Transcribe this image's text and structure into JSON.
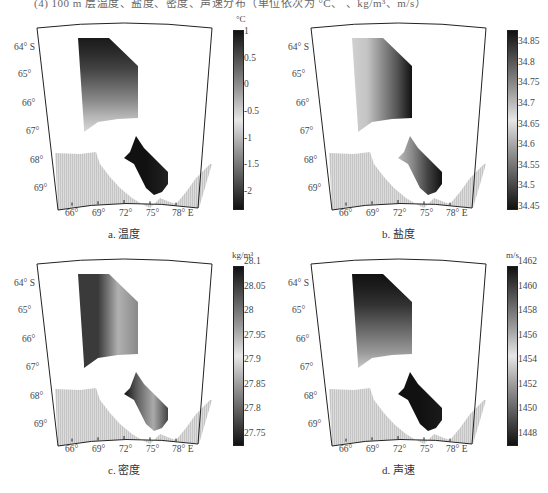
{
  "header_text": "(4) 100 m 层温度、盐度、密度、声速分布（单位依次为 °C、 、kg/m³、m/s）",
  "axes": {
    "lat_labels": [
      "64° S",
      "65°",
      "66°",
      "67°",
      "68°",
      "69°"
    ],
    "lon_labels": [
      "66°",
      "69°",
      "72°",
      "75°",
      "78° E"
    ]
  },
  "panels": [
    {
      "id": "a",
      "caption": "a. 温度",
      "unit": "°C",
      "colorbar_ticks": [
        "1",
        "0.5",
        "0",
        "-0.5",
        "-1",
        "-1.5",
        "-2"
      ],
      "colorbar_range": [
        -2.2,
        1.2
      ]
    },
    {
      "id": "b",
      "caption": "b. 盐度",
      "unit": "",
      "colorbar_ticks": [
        "34.85",
        "34.8",
        "34.75",
        "34.7",
        "34.65",
        "34.6",
        "34.55",
        "34.5",
        "34.45"
      ],
      "colorbar_range": [
        34.45,
        34.9
      ]
    },
    {
      "id": "c",
      "caption": "c. 密度",
      "unit": "kg/m³",
      "colorbar_ticks": [
        "28.1",
        "28.05",
        "28",
        "27.95",
        "27.9",
        "27.85",
        "27.8",
        "27.75"
      ],
      "colorbar_range": [
        27.75,
        28.1
      ]
    },
    {
      "id": "d",
      "caption": "d. 声速",
      "unit": "m/s",
      "colorbar_ticks": [
        "1462",
        "1460",
        "1458",
        "1456",
        "1454",
        "1452",
        "1450",
        "1448"
      ],
      "colorbar_range": [
        1447,
        1462
      ]
    }
  ],
  "colors": {
    "land": "#d4d4d4",
    "frame": "#222222",
    "colormap_stops": [
      "#111111",
      "#555555",
      "#999999",
      "#e6e6e6",
      "#999999",
      "#555555",
      "#111111"
    ]
  }
}
